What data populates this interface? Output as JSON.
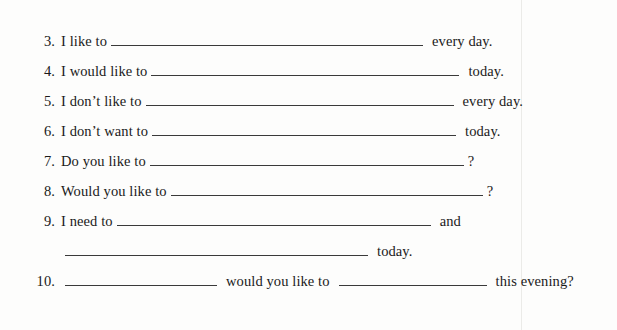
{
  "page": {
    "type": "fill-in-the-blank worksheet",
    "background_color": "#fdfdfc",
    "text_color": "#1a1a1a",
    "rule_color": "#3a3a3a"
  },
  "items": [
    {
      "number": "3.",
      "lead_text": "I like to",
      "blank_width": 312,
      "tail_text": "every day.",
      "tail_spaced": true
    },
    {
      "number": "4.",
      "lead_text": "I would like to",
      "blank_width": 308,
      "tail_text": "today.",
      "tail_spaced": true
    },
    {
      "number": "5.",
      "lead_text": "I don’t like to",
      "blank_width": 308,
      "tail_text": "every day.",
      "tail_spaced": true
    },
    {
      "number": "6.",
      "lead_text": "I don’t want to",
      "blank_width": 304,
      "tail_text": "today.",
      "tail_spaced": true
    },
    {
      "number": "7.",
      "lead_text": "Do you like to",
      "blank_width": 314,
      "tail_text": "?",
      "tail_spaced": false
    },
    {
      "number": "8.",
      "lead_text": "Would you like to",
      "blank_width": 312,
      "tail_text": "?",
      "tail_spaced": false
    },
    {
      "number": "9.",
      "lead_text": "I need to",
      "blank_width": 314,
      "tail_text": "and",
      "tail_spaced": true
    }
  ],
  "item9_continuation": {
    "blank_width": 303,
    "tail_text": "today."
  },
  "item10": {
    "number": "10.",
    "blank1_width": 152,
    "middle_text": "would you like to",
    "blank2_width": 148,
    "tail_text": "this evening?"
  }
}
